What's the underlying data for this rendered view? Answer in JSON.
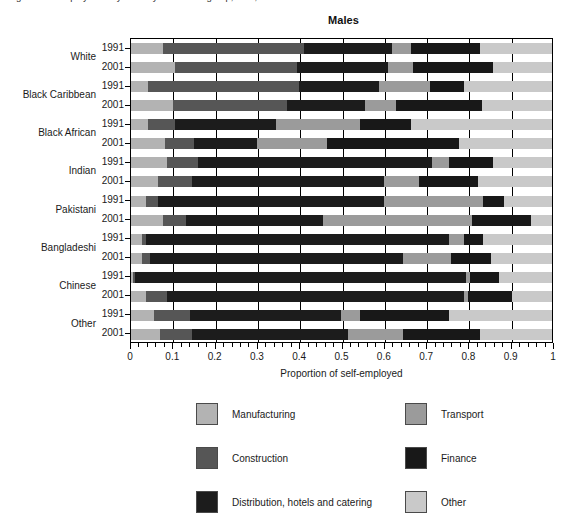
{
  "caption_sliver": "Figure   Self-employment by industry and ethnic group, men, 1991 and 2001",
  "chart": {
    "title": "Males",
    "xaxis_title": "Proportion of self-employed",
    "xtick_labels": [
      "0",
      "0.1",
      "0.2",
      "0.3",
      "0.4",
      "0.5",
      "0.6",
      "0.7",
      "0.8",
      "0.9",
      "1"
    ]
  },
  "legend": {
    "items": [
      {
        "label": "Manufacturing",
        "color": "#b3b3b3"
      },
      {
        "label": "Construction",
        "color": "#565656"
      },
      {
        "label": "Distribution, hotels and catering",
        "color": "#1c1c1c"
      },
      {
        "label": "Transport",
        "color": "#9b9b9b"
      },
      {
        "label": "Finance",
        "color": "#181818"
      },
      {
        "label": "Other",
        "color": "#c9c9c9"
      }
    ]
  },
  "chart_data": {
    "type": "bar",
    "orientation": "horizontal",
    "stacked": true,
    "normalized": true,
    "title": "Males",
    "xlabel": "Proportion of self-employed",
    "ylabel": "",
    "xlim": [
      0,
      1
    ],
    "xticks": [
      0,
      0.1,
      0.2,
      0.3,
      0.4,
      0.5,
      0.6,
      0.7,
      0.8,
      0.9,
      1
    ],
    "grid": true,
    "legend_position": "bottom",
    "series": [
      {
        "name": "Manufacturing",
        "color": "#b3b3b3"
      },
      {
        "name": "Construction",
        "color": "#565656"
      },
      {
        "name": "Distribution, hotels and catering",
        "color": "#1c1c1c"
      },
      {
        "name": "Transport",
        "color": "#9b9b9b"
      },
      {
        "name": "Finance",
        "color": "#181818"
      },
      {
        "name": "Other",
        "color": "#c9c9c9"
      }
    ],
    "groups": [
      {
        "category": "White",
        "rows": [
          {
            "year": "1991",
            "values": [
              0.075,
              0.335,
              0.21,
              0.045,
              0.165,
              0.17
            ]
          },
          {
            "year": "2001",
            "values": [
              0.105,
              0.29,
              0.215,
              0.06,
              0.19,
              0.14
            ]
          }
        ]
      },
      {
        "category": "Black Caribbean",
        "rows": [
          {
            "year": "1991",
            "values": [
              0.04,
              0.36,
              0.19,
              0.12,
              0.08,
              0.21
            ]
          },
          {
            "year": "2001",
            "values": [
              0.1,
              0.27,
              0.185,
              0.075,
              0.205,
              0.165
            ]
          }
        ]
      },
      {
        "category": "Black African",
        "rows": [
          {
            "year": "1991",
            "values": [
              0.04,
              0.065,
              0.24,
              0.2,
              0.12,
              0.335
            ]
          },
          {
            "year": "2001",
            "values": [
              0.08,
              0.07,
              0.15,
              0.165,
              0.315,
              0.22
            ]
          }
        ]
      },
      {
        "category": "Indian",
        "rows": [
          {
            "year": "1991",
            "values": [
              0.085,
              0.075,
              0.555,
              0.04,
              0.105,
              0.14
            ]
          },
          {
            "year": "2001",
            "values": [
              0.065,
              0.08,
              0.455,
              0.085,
              0.14,
              0.175
            ]
          }
        ]
      },
      {
        "category": "Pakistani",
        "rows": [
          {
            "year": "1991",
            "values": [
              0.035,
              0.03,
              0.535,
              0.235,
              0.05,
              0.115
            ]
          },
          {
            "year": "2001",
            "values": [
              0.075,
              0.055,
              0.325,
              0.355,
              0.14,
              0.05
            ]
          }
        ]
      },
      {
        "category": "Bangladeshi",
        "rows": [
          {
            "year": "1991",
            "values": [
              0.025,
              0.01,
              0.72,
              0.035,
              0.045,
              0.165
            ]
          },
          {
            "year": "2001",
            "values": [
              0.025,
              0.02,
              0.6,
              0.115,
              0.095,
              0.145
            ]
          }
        ]
      },
      {
        "category": "Chinese",
        "rows": [
          {
            "year": "1991",
            "values": [
              0.005,
              0.005,
              0.785,
              0.01,
              0.07,
              0.125
            ]
          },
          {
            "year": "2001",
            "values": [
              0.035,
              0.05,
              0.705,
              0.01,
              0.105,
              0.095
            ]
          }
        ]
      },
      {
        "category": "Other",
        "rows": [
          {
            "year": "1991",
            "values": [
              0.055,
              0.085,
              0.36,
              0.045,
              0.21,
              0.245
            ]
          },
          {
            "year": "2001",
            "values": [
              0.07,
              0.075,
              0.37,
              0.13,
              0.185,
              0.17
            ]
          }
        ]
      }
    ]
  }
}
